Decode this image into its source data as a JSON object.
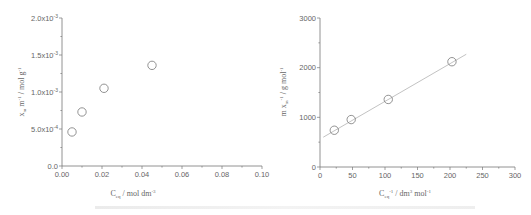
{
  "chart_data": [
    {
      "type": "scatter",
      "title": "",
      "xlabel": "C_eq / mol dm^-3",
      "ylabel": "x_m m^-1 / mol g^-1",
      "xlim": [
        0.0,
        0.1
      ],
      "ylim": [
        0.0,
        0.002
      ],
      "x_ticks": [
        "0.00",
        "0.02",
        "0.04",
        "0.06",
        "0.08",
        "0.10"
      ],
      "y_ticks": [
        "0.0",
        "5.0x10^-4",
        "1.0x10^-3",
        "1.5x10^-3",
        "2.0x10^-3"
      ],
      "grid": false,
      "legend": null,
      "series": [
        {
          "name": "data",
          "marker": "open-circle",
          "x": [
            0.005,
            0.01,
            0.021,
            0.045
          ],
          "y": [
            0.00046,
            0.00073,
            0.00105,
            0.00136
          ]
        }
      ]
    },
    {
      "type": "scatter",
      "title": "",
      "xlabel": "C_eq^-1 / dm^3 mol^-1",
      "ylabel": "m x_m^-1 / g mol^-1",
      "xlim": [
        0,
        300
      ],
      "ylim": [
        0,
        3000
      ],
      "x_ticks": [
        "0",
        "50",
        "100",
        "150",
        "200",
        "250",
        "300"
      ],
      "y_ticks": [
        "0",
        "1000",
        "2000",
        "3000"
      ],
      "grid": false,
      "legend": null,
      "series": [
        {
          "name": "data",
          "marker": "open-circle",
          "x": [
            22,
            48,
            105,
            203
          ],
          "y": [
            740,
            955,
            1360,
            2120
          ]
        },
        {
          "name": "linear fit",
          "type": "line",
          "x": [
            5,
            225
          ],
          "y": [
            600,
            2270
          ]
        }
      ]
    }
  ],
  "labels": {
    "left": {
      "y_main": "x",
      "y_sub": "m",
      "y_rest": " m",
      "y_sup1": "-1",
      "y_rest2": " / mol g",
      "y_sup2": "-1",
      "x_main": "C",
      "x_sub": "eq",
      "x_rest": " / mol dm",
      "x_sup": "-3"
    },
    "right": {
      "y_main": "m x",
      "y_sub": "m",
      "y_sup1": "-1",
      "y_rest": " / g mol",
      "y_sup2": "-1",
      "x_main": "C",
      "x_sub": "eq",
      "x_sup1": "-1",
      "x_rest": " / dm",
      "x_sup2": "3",
      "x_rest2": " mol",
      "x_sup3": "-1"
    }
  }
}
